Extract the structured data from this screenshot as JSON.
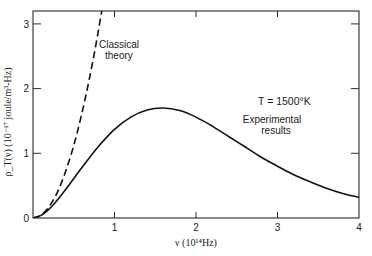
{
  "chart_data": {
    "type": "line",
    "title": "",
    "xlabel": "ν (10^14 Hz)",
    "ylabel": "ρ_T(ν) (10^-17 joule/m^3-Hz)",
    "xlim": [
      0,
      4
    ],
    "ylim": [
      0,
      3.2
    ],
    "x_ticks": [
      1,
      2,
      3,
      4
    ],
    "x_tick_labels": [
      "1",
      "2",
      "3",
      "4"
    ],
    "y_ticks": [
      0,
      1,
      2,
      3
    ],
    "y_tick_labels": [
      "0",
      "1",
      "2",
      "3"
    ],
    "grid": false,
    "legend": null,
    "series": [
      {
        "name": "Classical theory",
        "style": "dashed",
        "x": [
          0,
          0.1,
          0.2,
          0.3,
          0.4,
          0.5,
          0.6,
          0.7,
          0.8,
          0.85
        ],
        "values": [
          0,
          0.045,
          0.18,
          0.4,
          0.72,
          1.12,
          1.62,
          2.2,
          2.88,
          3.25
        ]
      },
      {
        "name": "Experimental results",
        "style": "solid",
        "x": [
          0,
          0.1,
          0.2,
          0.3,
          0.4,
          0.5,
          0.6,
          0.8,
          1.0,
          1.2,
          1.4,
          1.6,
          1.8,
          2.0,
          2.2,
          2.4,
          2.6,
          2.8,
          3.0,
          3.2,
          3.4,
          3.6,
          3.8,
          4.0
        ],
        "values": [
          0,
          0.04,
          0.14,
          0.28,
          0.44,
          0.61,
          0.78,
          1.1,
          1.37,
          1.56,
          1.67,
          1.7,
          1.66,
          1.56,
          1.42,
          1.26,
          1.1,
          0.94,
          0.8,
          0.67,
          0.56,
          0.46,
          0.38,
          0.32
        ]
      }
    ],
    "annotations": [
      {
        "text": "Classical theory",
        "x": 1.0,
        "y": 2.8
      },
      {
        "text": "Experimental results",
        "x": 2.45,
        "y": 1.45
      },
      {
        "text": "T = 1500°K",
        "x": 2.7,
        "y": 1.95
      }
    ]
  },
  "labels": {
    "y_axis_title": "ρ_T(ν) (10⁻¹⁷ joule/m³-Hz)",
    "x_axis_title": "ν (10¹⁴Hz)",
    "classical_line1": "Classical",
    "classical_line2": "theory",
    "experimental_line1": "Experimental",
    "experimental_line2": "results",
    "temperature": "T = 1500°K",
    "x_tick_1": "1",
    "x_tick_2": "2",
    "x_tick_3": "3",
    "x_tick_4": "4",
    "y_tick_0": "0",
    "y_tick_1": "1",
    "y_tick_2": "2",
    "y_tick_3": "3"
  }
}
